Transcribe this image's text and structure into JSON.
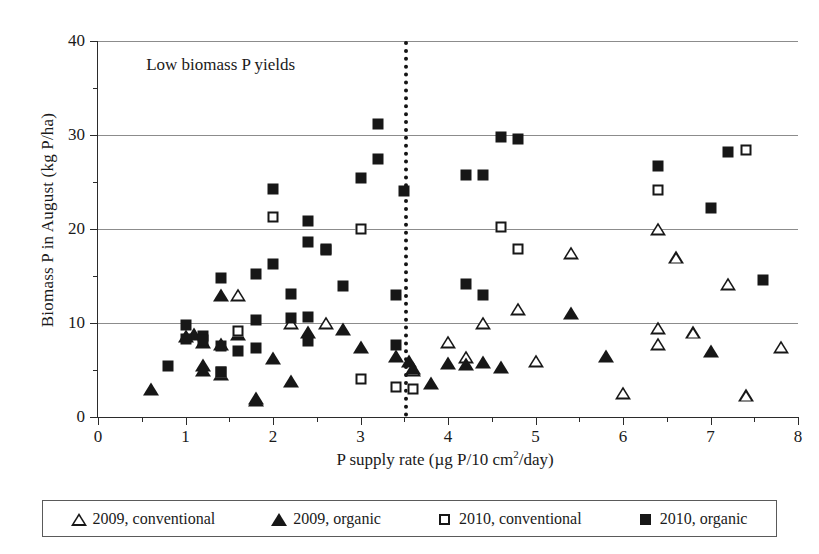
{
  "chart_data": {
    "type": "scatter",
    "title": "",
    "annotation": "Low biomass P yields",
    "xlabel": "P supply rate (µg P/10 cm²/day)",
    "ylabel": "Biomass P in August (kg P/ha)",
    "xlim": [
      0,
      8
    ],
    "ylim": [
      0,
      40
    ],
    "xticks": [
      0,
      1,
      2,
      3,
      4,
      5,
      6,
      7,
      8
    ],
    "xtick_labels": [
      "0",
      "1",
      "2",
      "3",
      "4",
      "5",
      "6",
      "7",
      "8"
    ],
    "xminor_step": 0.5,
    "yticks": [
      0,
      10,
      20,
      30,
      40
    ],
    "ytick_labels": [
      "0",
      "10",
      "20",
      "30",
      "40"
    ],
    "yminor": [
      5,
      15,
      25,
      35
    ],
    "grid": "horizontal-major",
    "legend_position": "below-plot",
    "reference_line": {
      "orientation": "vertical",
      "x": 3.5,
      "style": "dotted"
    },
    "series": [
      {
        "name": "2009, conventional",
        "marker": "triangle-open",
        "points": [
          [
            1.6,
            13.0
          ],
          [
            2.2,
            10.0
          ],
          [
            2.6,
            10.0
          ],
          [
            3.6,
            5.0
          ],
          [
            4.0,
            8.0
          ],
          [
            4.2,
            6.4
          ],
          [
            4.4,
            10.0
          ],
          [
            4.8,
            11.5
          ],
          [
            5.0,
            6.0
          ],
          [
            5.4,
            17.5
          ],
          [
            6.0,
            2.6
          ],
          [
            6.4,
            9.5
          ],
          [
            6.4,
            7.8
          ],
          [
            6.4,
            20.0
          ],
          [
            6.6,
            17.0
          ],
          [
            6.8,
            9.0
          ],
          [
            7.2,
            14.2
          ],
          [
            7.4,
            2.3
          ],
          [
            7.8,
            7.5
          ]
        ]
      },
      {
        "name": "2009, organic",
        "marker": "triangle-filled",
        "points": [
          [
            0.6,
            3.0
          ],
          [
            1.0,
            8.6
          ],
          [
            1.1,
            8.8
          ],
          [
            1.2,
            8.0
          ],
          [
            1.2,
            5.5
          ],
          [
            1.2,
            5.0
          ],
          [
            1.4,
            13.0
          ],
          [
            1.4,
            7.8
          ],
          [
            1.4,
            4.6
          ],
          [
            1.6,
            8.8
          ],
          [
            1.8,
            2.0
          ],
          [
            1.8,
            1.8
          ],
          [
            2.0,
            6.3
          ],
          [
            2.2,
            3.8
          ],
          [
            2.4,
            9.0
          ],
          [
            2.8,
            9.4
          ],
          [
            3.0,
            7.5
          ],
          [
            3.4,
            6.5
          ],
          [
            3.55,
            6.0
          ],
          [
            3.6,
            5.2
          ],
          [
            3.8,
            3.6
          ],
          [
            4.0,
            5.7
          ],
          [
            4.2,
            5.6
          ],
          [
            4.4,
            5.8
          ],
          [
            4.6,
            5.3
          ],
          [
            5.4,
            11.1
          ],
          [
            5.8,
            6.5
          ],
          [
            7.0,
            7.0
          ]
        ]
      },
      {
        "name": "2010, conventional",
        "marker": "square-open",
        "points": [
          [
            1.6,
            9.2
          ],
          [
            1.4,
            4.8
          ],
          [
            2.0,
            21.3
          ],
          [
            2.6,
            17.9
          ],
          [
            3.0,
            20.0
          ],
          [
            3.0,
            4.0
          ],
          [
            3.4,
            3.2
          ],
          [
            3.6,
            3.0
          ],
          [
            4.6,
            20.2
          ],
          [
            4.8,
            17.9
          ],
          [
            6.4,
            24.2
          ],
          [
            7.4,
            28.4
          ]
        ]
      },
      {
        "name": "2010, organic",
        "marker": "square-filled",
        "points": [
          [
            0.8,
            5.4
          ],
          [
            1.0,
            9.8
          ],
          [
            1.0,
            8.3
          ],
          [
            1.2,
            8.6
          ],
          [
            1.2,
            8.2
          ],
          [
            1.4,
            7.6
          ],
          [
            1.4,
            4.8
          ],
          [
            1.4,
            14.8
          ],
          [
            1.6,
            7.0
          ],
          [
            1.8,
            15.2
          ],
          [
            1.8,
            10.3
          ],
          [
            1.8,
            7.3
          ],
          [
            2.0,
            16.3
          ],
          [
            2.0,
            24.3
          ],
          [
            2.2,
            13.1
          ],
          [
            2.2,
            10.5
          ],
          [
            2.4,
            10.6
          ],
          [
            2.4,
            20.8
          ],
          [
            2.4,
            18.6
          ],
          [
            2.4,
            8.1
          ],
          [
            2.6,
            17.8
          ],
          [
            2.8,
            13.9
          ],
          [
            3.0,
            25.4
          ],
          [
            3.2,
            31.2
          ],
          [
            3.2,
            27.5
          ],
          [
            3.4,
            13.0
          ],
          [
            3.4,
            7.7
          ],
          [
            3.5,
            24.0
          ],
          [
            4.2,
            25.7
          ],
          [
            4.4,
            25.7
          ],
          [
            4.2,
            14.2
          ],
          [
            4.4,
            13.0
          ],
          [
            4.6,
            29.8
          ],
          [
            4.8,
            29.6
          ],
          [
            6.4,
            26.7
          ],
          [
            7.0,
            22.2
          ],
          [
            7.2,
            28.2
          ],
          [
            7.6,
            14.6
          ]
        ]
      }
    ]
  },
  "legend": {
    "entries": [
      {
        "label": "2009, conventional",
        "marker": "triangle-open-icon"
      },
      {
        "label": "2009, organic",
        "marker": "triangle-filled-icon"
      },
      {
        "label": "2010, conventional",
        "marker": "square-open-icon"
      },
      {
        "label": "2010, organic",
        "marker": "square-filled-icon"
      }
    ]
  },
  "colors": {
    "marker": "#171717",
    "axis": "#2b2b2b",
    "grid": "#8c8c8c",
    "background": "#ffffff"
  }
}
